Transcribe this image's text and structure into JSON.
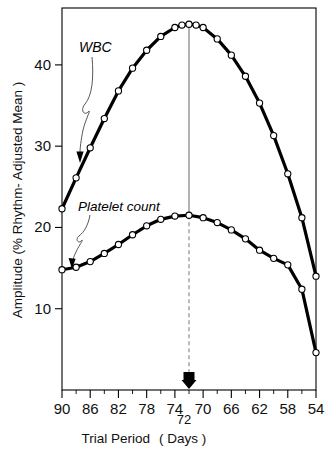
{
  "figure": {
    "name": "amplitude-vs-trial-period-chart",
    "background": "#ffffff",
    "ink": "#000000"
  },
  "chart_data": {
    "type": "line",
    "title": "",
    "xlabel": "Trial Period  ( Days )",
    "ylabel": "Amplitude (% Rhythm- Adjusted Mean )",
    "xlabel_parts": {
      "main": "Trial Period",
      "unit": "( Days )"
    },
    "ylabel_parts": {
      "main": "Amplitude",
      "unit": "(% Rhythm- Adjusted Mean )"
    },
    "x_axis_direction": "descending",
    "xlim": [
      90,
      54
    ],
    "ylim": [
      0,
      47
    ],
    "xticks": [
      90,
      86,
      82,
      78,
      74,
      70,
      66,
      62,
      58,
      54
    ],
    "xticklabels": [
      "90",
      "86",
      "82",
      "78",
      "74",
      "70",
      "66",
      "62",
      "58",
      "54"
    ],
    "xminorticks": [
      88,
      84,
      80,
      76,
      72,
      68,
      64,
      60,
      56
    ],
    "yticks": [
      10,
      20,
      30,
      40
    ],
    "yticklabels": [
      "10",
      "20",
      "30",
      "40"
    ],
    "grid": false,
    "legend": "none",
    "marker": "open-circle",
    "series": [
      {
        "name": "WBC",
        "label": "WBC",
        "color": "#000000",
        "x": [
          90,
          88,
          86,
          84,
          82,
          80,
          78,
          76,
          74,
          73,
          72,
          71,
          70,
          68,
          66,
          64,
          62,
          60,
          58,
          56,
          54
        ],
        "values": [
          22.3,
          26.1,
          29.8,
          33.4,
          36.8,
          39.6,
          41.8,
          43.5,
          44.6,
          44.9,
          45.0,
          44.9,
          44.6,
          43.2,
          41.2,
          38.6,
          35.3,
          31.3,
          26.6,
          21.2,
          14.0
        ]
      },
      {
        "name": "Platelet count",
        "label": "Platelet count",
        "color": "#000000",
        "x": [
          90,
          88,
          86,
          84,
          82,
          80,
          78,
          76,
          74,
          72,
          70,
          68,
          66,
          64,
          62,
          60,
          58,
          56,
          54
        ],
        "values": [
          14.8,
          15.1,
          15.8,
          16.8,
          17.9,
          19.1,
          20.2,
          21.0,
          21.4,
          21.5,
          21.2,
          20.6,
          19.7,
          18.6,
          17.2,
          16.2,
          15.4,
          12.4,
          4.6
        ]
      }
    ],
    "annotations": [
      {
        "name": "wbc-label",
        "text": "WBC",
        "style": "italic",
        "points_to": "upper-curve"
      },
      {
        "name": "platelet-label",
        "text": "Platelet count",
        "style": "italic",
        "points_to": "lower-curve"
      },
      {
        "name": "reference-marker",
        "text": "72",
        "x_value": 72,
        "description": "solid vertical line from WBC peak down to platelet peak, dashed below, with filled down-arrow at axis"
      }
    ]
  }
}
